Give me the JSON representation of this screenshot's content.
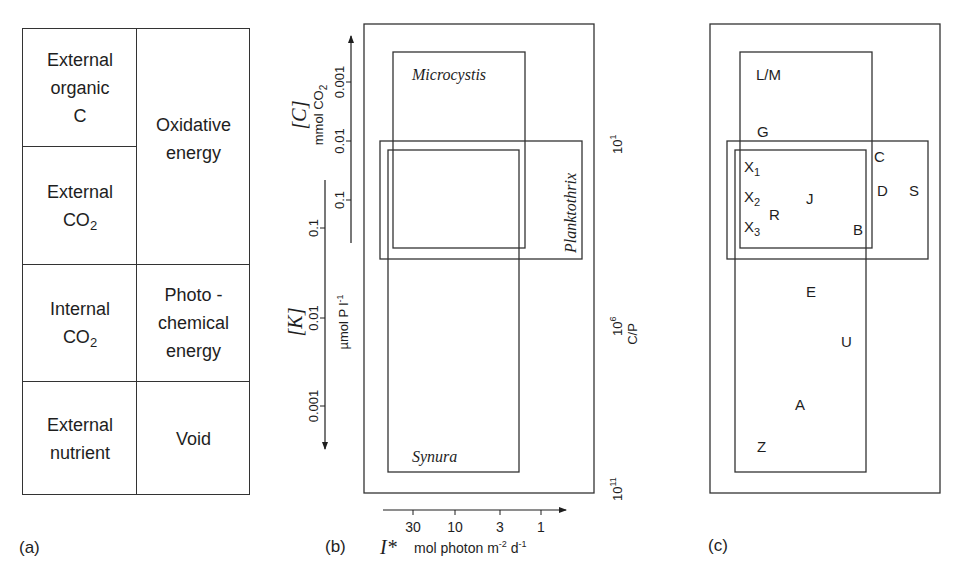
{
  "panels": {
    "a": {
      "label": "(a)",
      "cells": {
        "ext_org_c": [
          "External",
          "organic",
          "C"
        ],
        "ext_co2": [
          "External",
          "CO",
          "2"
        ],
        "int_co2": [
          "Internal",
          "CO",
          "2"
        ],
        "ext_nutrient": [
          "External",
          "nutrient"
        ],
        "oxidative": [
          "Oxidative",
          "energy"
        ],
        "photochemical": [
          "Photo -",
          "chemical",
          "energy"
        ],
        "void": [
          "Void"
        ]
      }
    },
    "b": {
      "label": "(b)",
      "boxes": {
        "microcystis": "Microcystis",
        "planktothrix": "Planktothrix",
        "synura": "Synura"
      },
      "axis_c": {
        "symbol": "[C]",
        "unit": "mmol CO",
        "unit_sub": "2",
        "ticks": [
          "0.001",
          "0.01",
          "0.1"
        ]
      },
      "axis_k": {
        "symbol": "[K]",
        "unit": "µmol P l",
        "unit_sup": "-1",
        "ticks": [
          "0.1",
          "0.01",
          "0.001"
        ]
      },
      "axis_i": {
        "symbol": "I*",
        "unit_pre": "mol photon m",
        "unit_sup1": "-2",
        "unit_mid": " d",
        "unit_sup2": "-1",
        "ticks": [
          "30",
          "10",
          "3",
          "1"
        ]
      },
      "axis_cp": {
        "label": "C/P",
        "ticks": [
          {
            "base": "10",
            "exp": "1"
          },
          {
            "base": "10",
            "exp": "6"
          },
          {
            "base": "10",
            "exp": "11"
          }
        ]
      }
    },
    "c": {
      "label": "(c)",
      "points": [
        {
          "id": "L/M",
          "sub": ""
        },
        {
          "id": "G",
          "sub": ""
        },
        {
          "id": "C",
          "sub": ""
        },
        {
          "id": "X",
          "sub": "1"
        },
        {
          "id": "D",
          "sub": ""
        },
        {
          "id": "S",
          "sub": ""
        },
        {
          "id": "X",
          "sub": "2"
        },
        {
          "id": "J",
          "sub": ""
        },
        {
          "id": "R",
          "sub": ""
        },
        {
          "id": "X",
          "sub": "3"
        },
        {
          "id": "B",
          "sub": ""
        },
        {
          "id": "E",
          "sub": ""
        },
        {
          "id": "U",
          "sub": ""
        },
        {
          "id": "A",
          "sub": ""
        },
        {
          "id": "Z",
          "sub": ""
        }
      ]
    }
  }
}
